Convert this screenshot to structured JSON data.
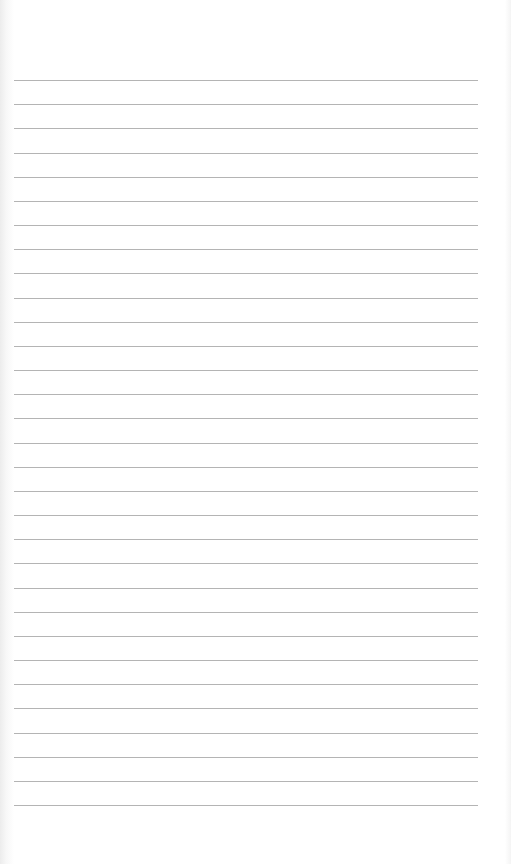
{
  "page": {
    "type": "lined-paper",
    "background_color": "#ffffff",
    "rule_color": "#b4b4b4",
    "rule_count": 31,
    "first_rule_y": 80,
    "rule_spacing": 24.17,
    "rule_left": 14,
    "rule_width": 464
  }
}
